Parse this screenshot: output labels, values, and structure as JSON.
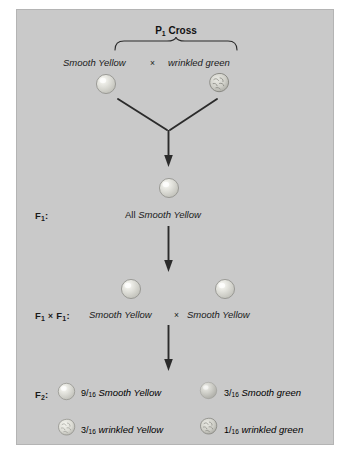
{
  "figure": {
    "title": "P1 Cross",
    "title_base": "P",
    "title_sub": "1",
    "title_rest": " Cross",
    "multiplication_sign": "×",
    "panel_color": "#c9c9c9",
    "text_color": "#1a1a1a",
    "arrow_color": "#2b2b2b"
  },
  "p1": {
    "stage_label": "P",
    "stage_label_sub": "1",
    "parent_left": "Smooth Yellow",
    "parent_right": "wrinkled green",
    "left_icon": "smooth-yellow-pea-icon",
    "right_icon": "wrinkled-green-pea-icon"
  },
  "f1": {
    "stage_label": "F",
    "stage_label_sub": "1",
    "stage_label_suffix": ":",
    "prefix": "All ",
    "phenotype": "Smooth Yellow",
    "icon": "smooth-yellow-pea-icon"
  },
  "f1cross": {
    "stage_label_a": "F",
    "stage_label_a_sub": "1",
    "stage_label_mid": "×",
    "stage_label_b": "F",
    "stage_label_b_sub": "1",
    "stage_label_suffix": ":",
    "parent_left": "Smooth Yellow",
    "parent_right": "Smooth Yellow",
    "left_icon": "smooth-yellow-pea-icon",
    "right_icon": "smooth-yellow-pea-icon"
  },
  "f2": {
    "stage_label": "F",
    "stage_label_sub": "2",
    "stage_label_suffix": ":",
    "offspring": [
      {
        "numerator": "9",
        "slash": "/",
        "denominator": "16",
        "phenotype": "Smooth Yellow",
        "icon": "smooth-yellow-pea-icon",
        "shape": "smooth",
        "color": "yellow"
      },
      {
        "numerator": "3",
        "slash": "/",
        "denominator": "16",
        "phenotype": "Smooth green",
        "icon": "smooth-green-pea-icon",
        "shape": "smooth",
        "color": "green"
      },
      {
        "numerator": "3",
        "slash": "/",
        "denominator": "16",
        "phenotype": "wrinkled Yellow",
        "icon": "wrinkled-yellow-pea-icon",
        "shape": "wrinkled",
        "color": "yellow"
      },
      {
        "numerator": "1",
        "slash": "/",
        "denominator": "16",
        "phenotype": "wrinkled green",
        "icon": "wrinkled-green-pea-icon",
        "shape": "wrinkled",
        "color": "green"
      }
    ]
  }
}
